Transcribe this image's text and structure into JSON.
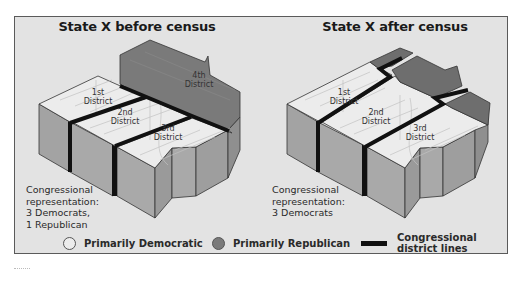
{
  "panels": [
    {
      "title": "State X before census",
      "districts": [
        {
          "label_line1": "1st",
          "label_line2": "District",
          "party": "Democratic"
        },
        {
          "label_line1": "2nd",
          "label_line2": "District",
          "party": "Democratic"
        },
        {
          "label_line1": "3rd",
          "label_line2": "District",
          "party": "Democratic"
        },
        {
          "label_line1": "4th",
          "label_line2": "District",
          "party": "Republican"
        }
      ],
      "representation": [
        "Congressional",
        "representation:",
        "3 Democrats,",
        "1 Republican"
      ]
    },
    {
      "title": "State X after census",
      "districts": [
        {
          "label_line1": "1st",
          "label_line2": "District",
          "party": "Democratic"
        },
        {
          "label_line1": "2nd",
          "label_line2": "District",
          "party": "Democratic"
        },
        {
          "label_line1": "3rd",
          "label_line2": "District",
          "party": "Democratic"
        }
      ],
      "representation": [
        "Congressional",
        "representation:",
        "3 Democrats"
      ]
    }
  ],
  "legend": {
    "democratic": {
      "label": "Primarily Democratic",
      "color": "#ececec"
    },
    "republican": {
      "label": "Primarily Republican",
      "color": "#7a7a7a"
    },
    "lines": {
      "label_line1": "Congressional",
      "label_line2": "district lines",
      "color": "#111111"
    }
  },
  "colors": {
    "frame_bg": "#e3e3e3",
    "top_light": "#ececec",
    "top_dark": "#7a7a7a",
    "side_front": "#a9a9a9",
    "side_left": "#8e8e8e",
    "street": "#c7c7c7",
    "district_line": "#111111"
  }
}
